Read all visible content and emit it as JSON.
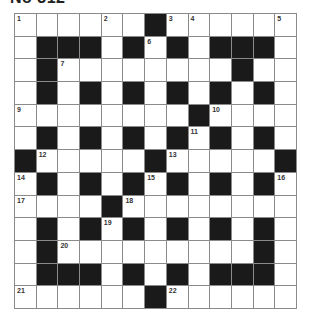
{
  "puzzle": {
    "title": "No 312",
    "rows": 13,
    "cols": 13,
    "colors": {
      "block": "#1a1a1a",
      "cell": "#ffffff",
      "gridline": "#8a8a8a",
      "number": "#333333"
    },
    "layout": [
      "......#......",
      ".###.#.#.###.",
      ".#........#..",
      ".#.#.#.#.#.#.",
      "........#....",
      ".#.#.#.#.#.#.",
      "#.....#.....#",
      ".#.#.#.#.#.#.",
      "....#........",
      ".#.#.#.#.#.#.",
      ".#.........#.",
      ".###.#.#.###.",
      "......#......"
    ],
    "numbers": [
      {
        "row": 0,
        "col": 0,
        "n": "1"
      },
      {
        "row": 0,
        "col": 4,
        "n": "2"
      },
      {
        "row": 0,
        "col": 7,
        "n": "3"
      },
      {
        "row": 0,
        "col": 8,
        "n": "4"
      },
      {
        "row": 0,
        "col": 12,
        "n": "5"
      },
      {
        "row": 1,
        "col": 6,
        "n": "6"
      },
      {
        "row": 2,
        "col": 2,
        "n": "7"
      },
      {
        "row": 2,
        "col": 10,
        "n": "8"
      },
      {
        "row": 4,
        "col": 0,
        "n": "9"
      },
      {
        "row": 4,
        "col": 9,
        "n": "10"
      },
      {
        "row": 5,
        "col": 8,
        "n": "11"
      },
      {
        "row": 6,
        "col": 1,
        "n": "12"
      },
      {
        "row": 6,
        "col": 7,
        "n": "13"
      },
      {
        "row": 7,
        "col": 0,
        "n": "14"
      },
      {
        "row": 7,
        "col": 6,
        "n": "15"
      },
      {
        "row": 7,
        "col": 12,
        "n": "16"
      },
      {
        "row": 8,
        "col": 0,
        "n": "17"
      },
      {
        "row": 8,
        "col": 5,
        "n": "18"
      },
      {
        "row": 9,
        "col": 4,
        "n": "19"
      },
      {
        "row": 10,
        "col": 2,
        "n": "20"
      },
      {
        "row": 12,
        "col": 0,
        "n": "21"
      },
      {
        "row": 12,
        "col": 7,
        "n": "22"
      }
    ]
  }
}
